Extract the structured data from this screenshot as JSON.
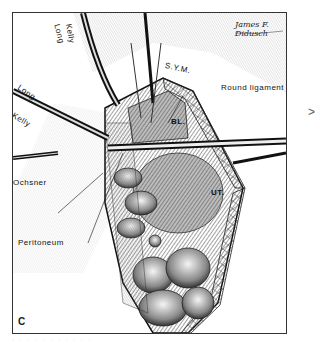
{
  "figure": {
    "panel_letter": "C",
    "signature": "James F. Didusch",
    "side_mark": ">",
    "caption_fragment": "· · · · · · · · · · ·",
    "labels": {
      "long_kelly_top_1": "Long",
      "long_kelly_top_2": "Kelly",
      "long_kelly_left_1": "Long",
      "long_kelly_left_2": "Kelly",
      "ochsner": "Ochsner",
      "peritoneum": "Peritoneum",
      "symphysis": "S.Y.M.",
      "round_ligament": "Round ligament",
      "bladder": "BL.",
      "uterus": "UT."
    },
    "colors": {
      "ink": "#1a1a1a",
      "paper": "#ffffff",
      "hatch_dark": "#3a3a3a",
      "hatch_mid": "#8a8a8a",
      "skin_light": "#e8e8e8"
    }
  }
}
